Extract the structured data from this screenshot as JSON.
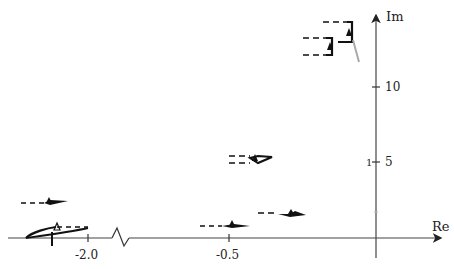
{
  "diagram": {
    "type": "complex-plane-root-locus",
    "axes": {
      "x_label": "Re",
      "y_label": "Im",
      "x_ticks": [
        {
          "label": "-2.0",
          "value": -2.0
        },
        {
          "label": "-0.5",
          "value": -0.5
        }
      ],
      "y_ticks": [
        {
          "label": "5",
          "value": 5
        },
        {
          "label": "10",
          "value": 10
        }
      ],
      "x_axis_break": true,
      "y_axis_small_mark": "1"
    },
    "colors": {
      "axis": "#444444",
      "trace": "#111111",
      "gray_trace": "#aaaaaa",
      "text": "#222222"
    },
    "branches": [
      {
        "name": "branch-top-right",
        "approx_re": -0.1,
        "approx_im": 13.3
      },
      {
        "name": "branch-top-left",
        "approx_re": -0.18,
        "approx_im": 12.5
      },
      {
        "name": "branch-mid",
        "approx_re": -0.45,
        "approx_im": 5.3
      },
      {
        "name": "branch-low-right",
        "approx_re": -0.3,
        "approx_im": 1.5
      },
      {
        "name": "branch-low-center",
        "approx_re": -0.5,
        "approx_im": 0.8
      },
      {
        "name": "branch-far-left-upper",
        "approx_re": -2.1,
        "approx_im": 2.5
      },
      {
        "name": "branch-far-left-lower",
        "approx_re": -2.1,
        "approx_im": 0.6
      }
    ]
  }
}
